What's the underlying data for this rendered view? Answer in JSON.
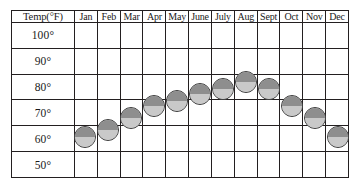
{
  "chart_data": {
    "type": "scatter",
    "title": "",
    "xlabel": "",
    "ylabel": "Temp(°F)",
    "grid": true,
    "legend": "none",
    "categories": [
      "Jan",
      "Feb",
      "Mar",
      "Apr",
      "May",
      "June",
      "July",
      "Aug",
      "Sept",
      "Oct",
      "Nov",
      "Dec"
    ],
    "values": [
      67,
      70,
      75,
      80,
      82,
      85,
      87,
      90,
      87,
      80,
      75,
      67
    ],
    "ylim": [
      45,
      105
    ],
    "ytick_labels": [
      "100°",
      "90°",
      "80°",
      "70°",
      "60°",
      "50°"
    ],
    "ytick_values": [
      100,
      90,
      80,
      70,
      60,
      50
    ],
    "marker": {
      "shape": "circle",
      "top_half_color": "#8e8e8e",
      "bottom_half_color": "#c9c9c9",
      "border_color": "#3d3d3d",
      "diameter_px": 22
    }
  },
  "table": {
    "corner_header": "Temp(°F)",
    "month_headers": [
      "Jan",
      "Feb",
      "Mar",
      "Apr",
      "May",
      "June",
      "July",
      "Aug",
      "Sept",
      "Oct",
      "Nov",
      "Dec"
    ],
    "row_labels": [
      "100°",
      "90°",
      "80°",
      "70°",
      "60°",
      "50°"
    ]
  },
  "colors": {
    "grid_line": "#231f20",
    "text": "#1a1a1a",
    "background": "#ffffff"
  }
}
